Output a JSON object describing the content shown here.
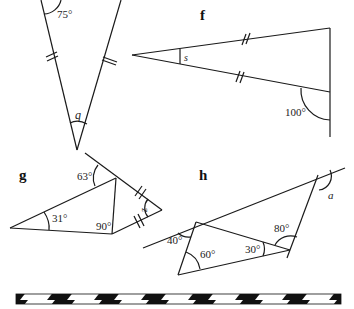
{
  "figures": {
    "e": {
      "angle_top": "75°",
      "unknown": "q"
    },
    "f": {
      "label": "f",
      "unknown": "s",
      "angle_exterior": "100°"
    },
    "g": {
      "label": "g",
      "angle_top_exterior": "63°",
      "angle_left": "31°",
      "angle_right": "90°",
      "unknown": "z"
    },
    "h": {
      "label": "h",
      "angle_exterior_left": "40°",
      "angle_interior_left": "60°",
      "angle_interior_right": "30°",
      "angle_exterior_right": "80°",
      "unknown": "a"
    }
  },
  "divider": {
    "style": "black-white-hazard-stripe"
  }
}
